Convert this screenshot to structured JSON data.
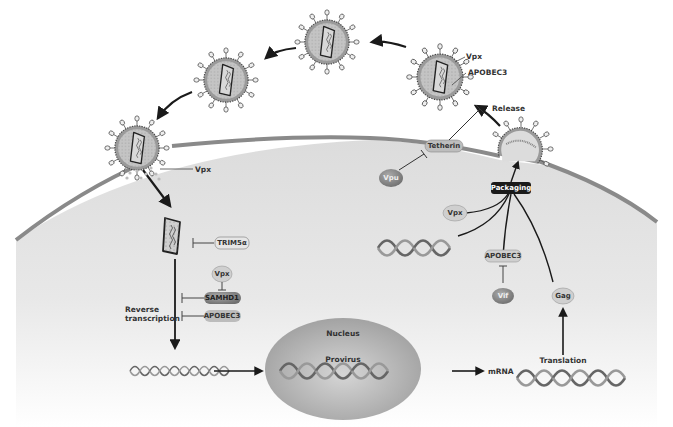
{
  "figure": {
    "type": "HIV lifecycle / host restriction factors diagram",
    "labels": {
      "vpx_top": "Vpx",
      "apobec3_top": "APOBEC3",
      "release": "Release",
      "tetherin": "Tetherin",
      "vpu": "Vpu",
      "packaging": "Packaging",
      "vpx_packaging": "Vpx",
      "apobec3_packaging": "APOBEC3",
      "vif": "Vif",
      "gag": "Gag",
      "translation": "Translation",
      "mrna": "mRNA",
      "nucleus": "Nucleus",
      "provirus": "Provirus",
      "vpx_entry": "Vpx",
      "trim5a": "TRIM5α",
      "vpx_samhd1": "Vpx",
      "samhd1": "SAMHD1",
      "apobec3_rt": "APOBEC3",
      "reverse_transcription_line1": "Reverse",
      "reverse_transcription_line2": "transcription"
    },
    "colors": {
      "cell_fill": "#e2e2e2",
      "membrane": "#8a8a8a",
      "virion_fill": "#b5b5b5",
      "nucleus_fill": "#a9a9a9",
      "pill_light": "#d9d9d9",
      "pill_dark": "#8c8c8c",
      "arrow": "#1a1a1a"
    }
  }
}
